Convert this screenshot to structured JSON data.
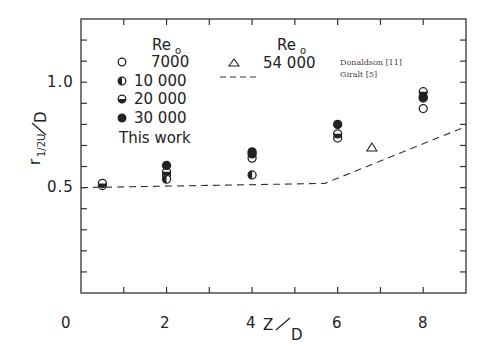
{
  "chart_data": {
    "type": "scatter",
    "title": "",
    "xlabel": "Z / D",
    "ylabel": "r_{1/2U} / D",
    "xlim": [
      0,
      9
    ],
    "ylim": [
      0,
      1.3
    ],
    "xticks_labeled": [
      0,
      2,
      4,
      6,
      8
    ],
    "xticks_minor": [
      1,
      3,
      5,
      7
    ],
    "yticks_labeled": [
      0.5,
      1.0
    ],
    "yticks_minor": [
      0.1,
      0.2,
      0.3,
      0.4,
      0.6,
      0.7,
      0.8,
      0.9,
      1.1,
      1.2
    ],
    "grid": false,
    "legend": {
      "header_left": "Re",
      "header_left_sub": "o",
      "header_right": "Re",
      "header_right_sub": "o",
      "this_work_label": "This work",
      "entries": [
        {
          "symbol": "open-circle",
          "label": "7000"
        },
        {
          "symbol": "left-half-filled-circle",
          "label": "10 000"
        },
        {
          "symbol": "bottom-half-filled-circle",
          "label": "20 000"
        },
        {
          "symbol": "filled-circle",
          "label": "30 000"
        }
      ],
      "other_entries": [
        {
          "symbol": "open-triangle",
          "label": "54 000",
          "source": "Donaldson [11]"
        },
        {
          "symbol": "dashed-line",
          "label": "",
          "source": "Giralt [5]"
        }
      ]
    },
    "series": [
      {
        "name": "Re 7000 (This work)",
        "marker": "open-circle",
        "x": [
          0.5,
          2,
          4,
          6,
          8
        ],
        "y": [
          0.51,
          0.56,
          0.64,
          0.735,
          0.875
        ]
      },
      {
        "name": "Re 10 000 (This work)",
        "marker": "left-half-filled-circle",
        "x": [
          2,
          4,
          8
        ],
        "y": [
          0.54,
          0.56,
          0.925
        ]
      },
      {
        "name": "Re 20 000 (This work)",
        "marker": "bottom-half-filled-circle",
        "x": [
          0.5,
          2,
          4,
          6,
          8
        ],
        "y": [
          0.52,
          0.575,
          0.66,
          0.755,
          0.955
        ]
      },
      {
        "name": "Re 30 000 (This work)",
        "marker": "filled-circle",
        "x": [
          2,
          4,
          6,
          8
        ],
        "y": [
          0.605,
          0.67,
          0.8,
          0.93
        ]
      },
      {
        "name": "Re 54 000 Donaldson [11]",
        "marker": "open-triangle",
        "x": [
          6.8
        ],
        "y": [
          0.69
        ]
      },
      {
        "name": "Giralt [5]",
        "marker": "dashed-line",
        "x": [
          0,
          5.7,
          9.0
        ],
        "y": [
          0.5,
          0.52,
          0.79
        ]
      }
    ]
  },
  "labels": {
    "x_zero": "0",
    "x_2": "2",
    "x_4": "4",
    "x_6": "6",
    "x_8": "8",
    "y_05": "0.5",
    "y_10": "1.0",
    "xlabel_z": "Z",
    "xlabel_d": "D",
    "ylabel_r": "r",
    "ylabel_sub": "1/2U",
    "ylabel_d": "D"
  }
}
